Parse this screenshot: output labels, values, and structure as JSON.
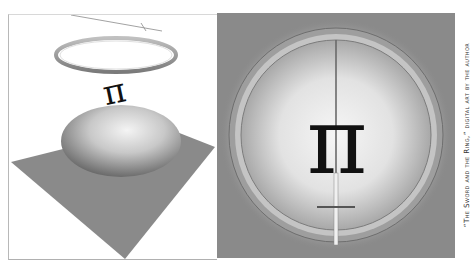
{
  "artwork": {
    "left_panel": {
      "description": "3D scene: thin sword seen edge-on above a floating ring, a pi symbol, and a dome on a gray diamond plane",
      "pi_symbol": "π",
      "colors": {
        "background": "#ffffff",
        "plane": "#8a8a8a",
        "dome_highlight": "#f2f2f2",
        "dome_shadow": "#6e6e6e",
        "ring": "#9a9a9a"
      }
    },
    "right_panel": {
      "description": "Top-down view: large ring around a glowing sphere with a sword piercing vertically through a pi symbol",
      "pi_symbol": "π",
      "colors": {
        "background": "#8a8a8a",
        "glow": "#f4f4f4",
        "ring": "#b5b5b5",
        "pi": "#111111"
      }
    },
    "caption": "“The Sword and the Ring,” digital art by the author"
  }
}
